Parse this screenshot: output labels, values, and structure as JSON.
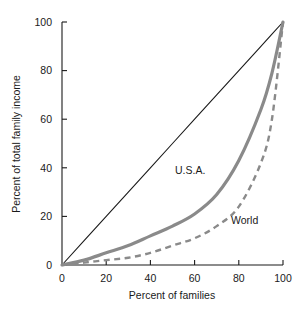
{
  "chart_data": {
    "type": "line",
    "title": "",
    "xlabel": "Percent of families",
    "ylabel": "Percent of total family income",
    "xlim": [
      0,
      100
    ],
    "ylim": [
      0,
      100
    ],
    "xticks": [
      "0",
      "20",
      "40",
      "60",
      "80",
      "100"
    ],
    "yticks": [
      "0",
      "20",
      "40",
      "60",
      "80",
      "100"
    ],
    "xtick_values": [
      0,
      20,
      40,
      60,
      80,
      100
    ],
    "ytick_values": [
      0,
      20,
      40,
      60,
      80,
      100
    ],
    "grid": false,
    "legend": "inline-annotations",
    "x": [
      0,
      10,
      20,
      30,
      40,
      50,
      60,
      70,
      80,
      90,
      95,
      100
    ],
    "series": [
      {
        "name": "Line of equality",
        "style": "solid-thin-black",
        "color": "#1a1a1a",
        "values": [
          0,
          10,
          20,
          30,
          40,
          50,
          60,
          70,
          80,
          90,
          95,
          100
        ]
      },
      {
        "name": "U.S.A.",
        "style": "solid-thick-gray",
        "color": "#8a8a8a",
        "values": [
          0,
          2,
          5,
          8,
          12,
          16,
          21,
          29,
          43,
          64,
          79,
          100
        ]
      },
      {
        "name": "World",
        "style": "dashed-gray",
        "color": "#8a8a8a",
        "values": [
          0,
          1,
          2,
          3,
          5,
          8,
          11,
          16,
          24,
          42,
          60,
          100
        ]
      }
    ],
    "annotations": [
      {
        "text": "U.S.A.",
        "x": 50,
        "y": 42
      },
      {
        "text": "World",
        "x": 76,
        "y": 20
      }
    ]
  },
  "colors": {
    "axis": "#1a1a1a",
    "equality_line": "#1a1a1a",
    "usa_curve": "#8a8a8a",
    "world_curve": "#8a8a8a",
    "background": "#ffffff",
    "text": "#1a1a1a"
  }
}
